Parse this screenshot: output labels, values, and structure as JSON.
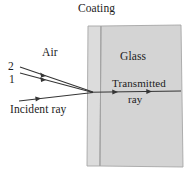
{
  "figure": {
    "background_color": "#ffffff",
    "width": 192,
    "height": 172
  },
  "regions": {
    "air": {
      "label": "Air",
      "fill": "#ffffff"
    },
    "coating": {
      "label": "Coating",
      "fill": "#dcdcdc",
      "stroke": "#9a9a9a"
    },
    "glass": {
      "label": "Glass",
      "fill": "#d5d5d5",
      "stroke": "#9a9a9a"
    }
  },
  "rays": {
    "incident": {
      "label": "Incident ray",
      "color": "#333333"
    },
    "ray_2": {
      "label": "2",
      "color": "#333333"
    },
    "ray_1": {
      "label": "1",
      "color": "#333333"
    },
    "transmitted": {
      "label_line1": "Transmitted",
      "label_line2": "ray",
      "color": "#333333"
    }
  }
}
